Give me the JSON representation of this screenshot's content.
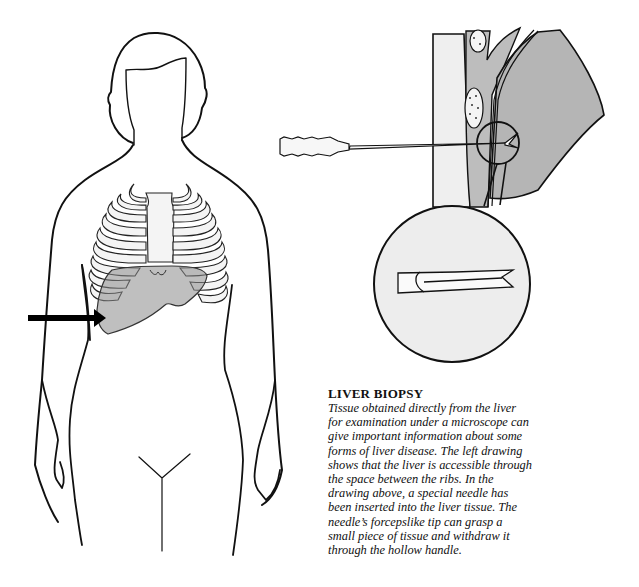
{
  "figure": {
    "left_drawing": "woman-torso-with-ribcage-and-liver",
    "right_drawing": "cross-section-needle-inserted-into-liver",
    "inset": "magnified-forceps-needle-tip",
    "colors": {
      "ink": "#111111",
      "tissue_gray": "#bdbdbd",
      "light_gray": "#ececec",
      "liver_gray": "#a9a9a9"
    }
  },
  "caption": {
    "title": "LIVER BIOPSY",
    "lines": [
      "Tissue obtained directly from the liver",
      "for examination under a microscope can",
      "give important information about some",
      "forms of liver disease. The left drawing",
      "shows that the liver is accessible through",
      "the space between the ribs. In the",
      "drawing above, a special needle has",
      "been inserted into the liver tissue. The",
      "needle’s forcepslike tip can grasp a",
      "small piece of tissue and withdraw it",
      "through the hollow handle."
    ]
  }
}
